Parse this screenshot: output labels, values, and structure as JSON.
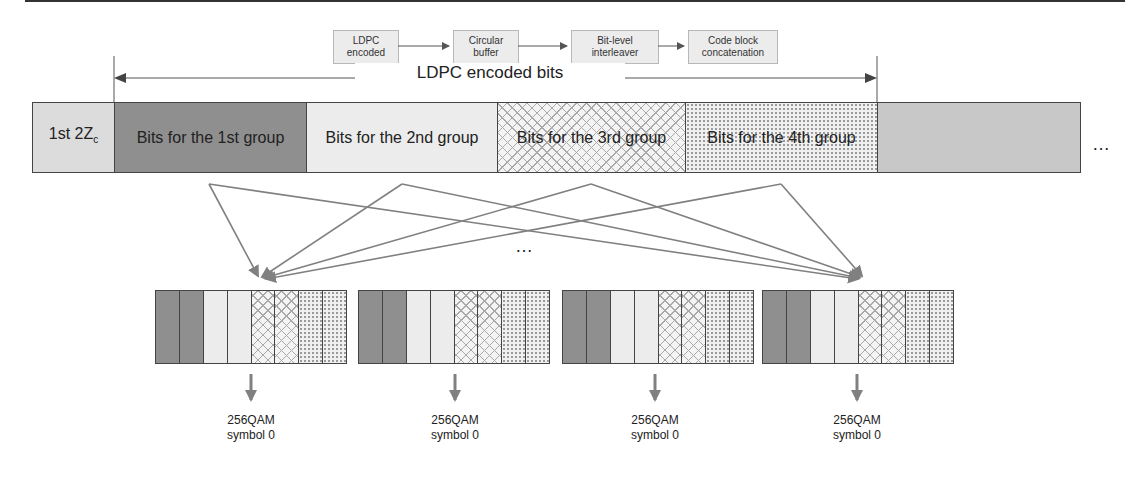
{
  "pipeline": {
    "steps": [
      {
        "label": "LDPC\nencoded"
      },
      {
        "label": "Circular\nbuffer"
      },
      {
        "label": "Bit-level\ninterleaver"
      },
      {
        "label": "Code block\nconcatenation"
      }
    ]
  },
  "span_label": "LDPC encoded bits",
  "main_bar": {
    "segments": [
      {
        "label": "1st 2Z",
        "subscript": "c",
        "fill": "light"
      },
      {
        "label": "Bits for the 1st group",
        "fill": "dark"
      },
      {
        "label": "Bits for the 2nd group",
        "fill": "pale"
      },
      {
        "label": "Bits for the 3rd group",
        "fill": "crosshatch"
      },
      {
        "label": "Bits for the 4th group",
        "fill": "dots"
      },
      {
        "label": "",
        "fill": "grey"
      }
    ],
    "trailing_ellipsis": "…"
  },
  "middle_ellipsis": "…",
  "symbols": [
    {
      "modulation": "256QAM",
      "name": "symbol 0"
    },
    {
      "modulation": "256QAM",
      "name": "symbol 0"
    },
    {
      "modulation": "256QAM",
      "name": "symbol 0"
    },
    {
      "modulation": "256QAM",
      "name": "symbol 0"
    }
  ],
  "symbol_cell_pattern": [
    "dark",
    "dark",
    "pale",
    "pale",
    "crosshatch",
    "crosshatch",
    "dots",
    "dots"
  ],
  "colors": {
    "dark": "#8f8f8f",
    "light": "#dcdcdc",
    "pale": "#ececec",
    "grey": "#c8c8c8",
    "line": "#7a7a7a",
    "arrow": "#808080"
  }
}
